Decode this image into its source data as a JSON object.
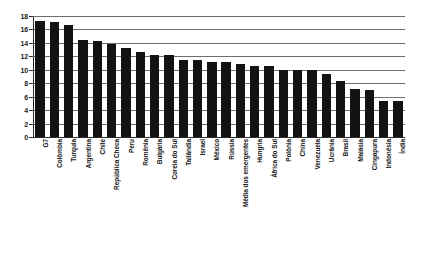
{
  "chart_data": {
    "type": "bar",
    "title": "",
    "subtitle": "",
    "xlabel": "",
    "ylabel": "",
    "ylim": [
      0,
      18
    ],
    "ytick_step": 2,
    "yticks": [
      0,
      2,
      4,
      6,
      8,
      10,
      12,
      14,
      16,
      18
    ],
    "ytick_labels": [
      "0",
      "2",
      "4",
      "6",
      "8",
      "10",
      "12",
      "14",
      "16",
      "18"
    ],
    "grid": true,
    "grid_axis": "y",
    "legend": false,
    "legend_position": "none",
    "bar_color": "#131313",
    "grid_color": "#6d6d6d",
    "axis_color": "#2b2b2b",
    "background_color": "#ffffff",
    "orientation": "vertical",
    "categories": [
      "G7",
      "Colômbia",
      "Turquia",
      "Argentina",
      "Chile",
      "República Checa",
      "Peru",
      "Romênia",
      "Bulgária",
      "Coreia do Sul",
      "Tailândia",
      "Israel",
      "México",
      "Rússia",
      "Média dos emergentes",
      "Hungria",
      "África do Sul",
      "Polônia",
      "China",
      "Venezuela",
      "Ucrânia",
      "Brasil",
      "Malásia",
      "Cingapura",
      "Indonésia",
      "Índia"
    ],
    "values": [
      17.3,
      17.1,
      16.7,
      14.5,
      14.3,
      13.9,
      13.3,
      12.7,
      12.2,
      12.2,
      11.5,
      11.4,
      11.2,
      11.1,
      10.9,
      10.6,
      10.5,
      10.0,
      10.0,
      10.0,
      9.3,
      8.3,
      7.2,
      7.0,
      5.4,
      5.3
    ]
  }
}
